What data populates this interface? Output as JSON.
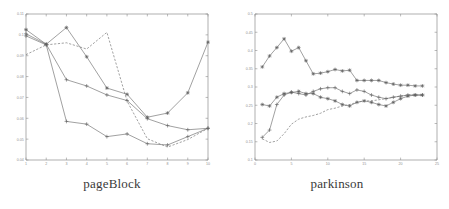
{
  "figure": {
    "background": "#ffffff",
    "line_color": "#6e6e6e",
    "axis_color": "#8d8d8d",
    "caption_color": "#3a3a3a"
  },
  "panels": [
    {
      "id": "left",
      "caption": "pageBlock"
    },
    {
      "id": "right",
      "caption": "parkinson"
    }
  ],
  "chart_data": [
    {
      "type": "line",
      "title": "pageBlock",
      "xlabel": "",
      "ylabel": "",
      "xlim": [
        1,
        10
      ],
      "ylim": [
        0.04,
        0.11
      ],
      "grid": false,
      "legend": "none",
      "xticks": [
        1,
        2,
        3,
        4,
        5,
        6,
        7,
        8,
        9,
        10
      ],
      "xticklabels": [
        "1",
        "2",
        "3",
        "4",
        "5",
        "6",
        "7",
        "8",
        "9",
        "10"
      ],
      "yticks": [
        0.04,
        0.05,
        0.06,
        0.07,
        0.08,
        0.09,
        0.1,
        0.11
      ],
      "yticklabels": [
        "0.04",
        "0.05",
        "0.06",
        "0.07",
        "0.08",
        "0.09",
        "0.1",
        "0.11"
      ],
      "x": [
        1,
        2,
        3,
        4,
        5,
        6,
        7,
        8,
        9,
        10
      ],
      "series": [
        {
          "name": "series-1",
          "marker": "asterisk",
          "linestyle": "solid",
          "values": [
            0.1025,
            0.0955,
            0.1035,
            0.0895,
            0.0745,
            0.0715,
            0.0605,
            0.0625,
            0.0722,
            0.0965
          ]
        },
        {
          "name": "series-2",
          "marker": "plus",
          "linestyle": "solid",
          "values": [
            0.1005,
            0.0955,
            0.0785,
            0.0755,
            0.0712,
            0.0685,
            0.0598,
            0.0565,
            0.0545,
            0.0552
          ]
        },
        {
          "name": "series-3",
          "marker": "plus",
          "linestyle": "solid",
          "values": [
            0.0995,
            0.0952,
            0.0585,
            0.0572,
            0.0512,
            0.0525,
            0.0478,
            0.0472,
            0.0512,
            0.0552
          ]
        },
        {
          "name": "series-4",
          "marker": "none",
          "linestyle": "dashed",
          "values": [
            0.0905,
            0.0952,
            0.0962,
            0.0932,
            0.1012,
            0.0682,
            0.0502,
            0.0462,
            0.0498,
            0.0552
          ]
        }
      ]
    },
    {
      "type": "line",
      "title": "parkinson",
      "xlabel": "",
      "ylabel": "",
      "xlim": [
        0,
        25
      ],
      "ylim": [
        0.1,
        0.5
      ],
      "grid": false,
      "legend": "none",
      "xticks": [
        0,
        5,
        10,
        15,
        20,
        25
      ],
      "xticklabels": [
        "0",
        "5",
        "10",
        "15",
        "20",
        "25"
      ],
      "yticks": [
        0.1,
        0.15,
        0.2,
        0.25,
        0.3,
        0.35,
        0.4,
        0.45,
        0.5
      ],
      "yticklabels": [
        "0.1",
        "0.15",
        "0.2",
        "0.25",
        "0.3",
        "0.35",
        "0.4",
        "0.45",
        "0.5"
      ],
      "x": [
        1,
        2,
        3,
        4,
        5,
        6,
        7,
        8,
        9,
        10,
        11,
        12,
        13,
        14,
        15,
        16,
        17,
        18,
        19,
        20,
        21,
        22,
        23
      ],
      "series": [
        {
          "name": "series-1",
          "marker": "asterisk",
          "linestyle": "solid",
          "values": [
            0.355,
            0.385,
            0.408,
            0.432,
            0.398,
            0.408,
            0.372,
            0.336,
            0.338,
            0.342,
            0.348,
            0.344,
            0.346,
            0.318,
            0.318,
            0.318,
            0.318,
            0.312,
            0.308,
            0.305,
            0.305,
            0.303,
            0.303
          ]
        },
        {
          "name": "series-2",
          "marker": "asterisk",
          "linestyle": "solid",
          "values": [
            0.252,
            0.248,
            0.272,
            0.282,
            0.285,
            0.288,
            0.282,
            0.282,
            0.272,
            0.268,
            0.262,
            0.252,
            0.248,
            0.258,
            0.262,
            0.258,
            0.252,
            0.248,
            0.258,
            0.268,
            0.275,
            0.278,
            0.278
          ]
        },
        {
          "name": "series-3",
          "marker": "plus",
          "linestyle": "solid",
          "values": [
            0.162,
            0.182,
            0.252,
            0.278,
            0.286,
            0.282,
            0.278,
            0.288,
            0.295,
            0.298,
            0.298,
            0.288,
            0.282,
            0.292,
            0.288,
            0.278,
            0.272,
            0.268,
            0.272,
            0.275,
            0.278,
            0.278,
            0.278
          ]
        },
        {
          "name": "series-4",
          "marker": "none",
          "linestyle": "dashed",
          "values": [
            0.158,
            0.148,
            0.152,
            0.172,
            0.198,
            0.212,
            0.218,
            0.222,
            0.228,
            0.238,
            0.242,
            0.248,
            0.252,
            0.258,
            0.262,
            0.262,
            0.265,
            0.268,
            0.272,
            0.275,
            0.278,
            0.278,
            0.278
          ]
        }
      ]
    }
  ]
}
